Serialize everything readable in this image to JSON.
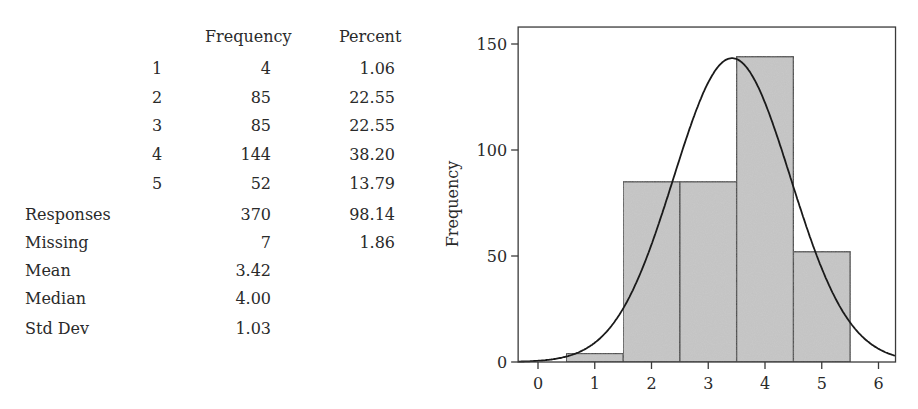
{
  "table": {
    "headers": {
      "frequency": "Frequency",
      "percent": "Percent"
    },
    "rows": [
      {
        "code": "1",
        "frequency": "4",
        "percent": "1.06"
      },
      {
        "code": "2",
        "frequency": "85",
        "percent": "22.55"
      },
      {
        "code": "3",
        "frequency": "85",
        "percent": "22.55"
      },
      {
        "code": "4",
        "frequency": "144",
        "percent": "38.20"
      },
      {
        "code": "5",
        "frequency": "52",
        "percent": "13.79"
      }
    ],
    "summary": [
      {
        "label": "Responses",
        "frequency": "370",
        "percent": "98.14"
      },
      {
        "label": "Missing",
        "frequency": "7",
        "percent": "1.86"
      },
      {
        "label": "Mean",
        "frequency": "3.42",
        "percent": ""
      },
      {
        "label": "Median",
        "frequency": "4.00",
        "percent": ""
      },
      {
        "label": "Std Dev",
        "frequency": "1.03",
        "percent": ""
      }
    ]
  },
  "chart_data": {
    "type": "bar",
    "subtype": "histogram with normal curve overlay",
    "title": "",
    "xlabel": "",
    "ylabel": "Frequency",
    "categories": [
      "1",
      "2",
      "3",
      "4",
      "5"
    ],
    "bin_edges": [
      0.5,
      1.5,
      2.5,
      3.5,
      4.5,
      5.5
    ],
    "values": [
      4,
      85,
      85,
      144,
      52
    ],
    "normal_curve": {
      "mean": 3.42,
      "sd": 1.03,
      "n": 370,
      "bin_width": 1
    },
    "xlim": [
      -0.35,
      6.3
    ],
    "ylim": [
      0,
      158
    ],
    "xticks": [
      "0",
      "1",
      "2",
      "3",
      "4",
      "5",
      "6"
    ],
    "yticks": [
      "0",
      "50",
      "100",
      "150"
    ],
    "grid": false,
    "legend": null,
    "colors": {
      "bar_fill": "#c9c9c9",
      "bar_edge": "#3a3a3a",
      "curve": "#1a1a1a",
      "frame": "#3a3a3a"
    }
  }
}
